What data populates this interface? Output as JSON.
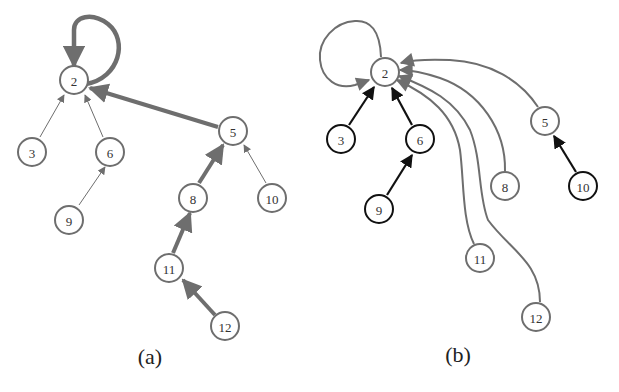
{
  "panels": [
    {
      "id": "a",
      "caption": "(a)",
      "nodes": [
        {
          "id": "2",
          "label": "2",
          "x": 74,
          "y": 80
        },
        {
          "id": "3",
          "label": "3",
          "x": 32,
          "y": 152
        },
        {
          "id": "6",
          "label": "6",
          "x": 110,
          "y": 152
        },
        {
          "id": "9",
          "label": "9",
          "x": 69,
          "y": 220
        },
        {
          "id": "5",
          "label": "5",
          "x": 233,
          "y": 131
        },
        {
          "id": "8",
          "label": "8",
          "x": 193,
          "y": 198
        },
        {
          "id": "10",
          "label": "10",
          "x": 272,
          "y": 198
        },
        {
          "id": "11",
          "label": "11",
          "x": 169,
          "y": 268
        },
        {
          "id": "12",
          "label": "12",
          "x": 225,
          "y": 326
        }
      ],
      "edges": [
        {
          "from": "2",
          "to": "2",
          "weight": "thick",
          "type": "self-loop"
        },
        {
          "from": "3",
          "to": "2",
          "weight": "thin"
        },
        {
          "from": "6",
          "to": "2",
          "weight": "thin"
        },
        {
          "from": "9",
          "to": "6",
          "weight": "thin"
        },
        {
          "from": "5",
          "to": "2",
          "weight": "thick"
        },
        {
          "from": "8",
          "to": "5",
          "weight": "thick"
        },
        {
          "from": "10",
          "to": "5",
          "weight": "thin"
        },
        {
          "from": "11",
          "to": "8",
          "weight": "thick"
        },
        {
          "from": "12",
          "to": "11",
          "weight": "thick"
        }
      ]
    },
    {
      "id": "b",
      "caption": "(b)",
      "nodes": [
        {
          "id": "2",
          "label": "2",
          "x": 385,
          "y": 72,
          "style": "gray"
        },
        {
          "id": "3",
          "label": "3",
          "x": 341,
          "y": 139,
          "style": "black"
        },
        {
          "id": "6",
          "label": "6",
          "x": 420,
          "y": 139,
          "style": "black"
        },
        {
          "id": "9",
          "label": "9",
          "x": 379,
          "y": 209,
          "style": "black"
        },
        {
          "id": "5",
          "label": "5",
          "x": 545,
          "y": 121,
          "style": "gray"
        },
        {
          "id": "8",
          "label": "8",
          "x": 505,
          "y": 186,
          "style": "gray"
        },
        {
          "id": "10",
          "label": "10",
          "x": 583,
          "y": 186,
          "style": "black"
        },
        {
          "id": "11",
          "label": "11",
          "x": 480,
          "y": 258,
          "style": "gray"
        },
        {
          "id": "12",
          "label": "12",
          "x": 536,
          "y": 317,
          "style": "gray"
        }
      ],
      "edges": [
        {
          "from": "2",
          "to": "2",
          "color": "gray",
          "type": "self-loop"
        },
        {
          "from": "3",
          "to": "2",
          "color": "black"
        },
        {
          "from": "6",
          "to": "2",
          "color": "black"
        },
        {
          "from": "9",
          "to": "6",
          "color": "black"
        },
        {
          "from": "10",
          "to": "5",
          "color": "black"
        },
        {
          "from": "5",
          "to": "2",
          "color": "gray",
          "type": "curved"
        },
        {
          "from": "8",
          "to": "2",
          "color": "gray",
          "type": "curved"
        },
        {
          "from": "11",
          "to": "2",
          "color": "gray",
          "type": "curved"
        },
        {
          "from": "12",
          "to": "2",
          "color": "gray",
          "type": "curved"
        }
      ]
    }
  ],
  "colors": {
    "gray": "#6e6e6e",
    "black": "#111111"
  }
}
